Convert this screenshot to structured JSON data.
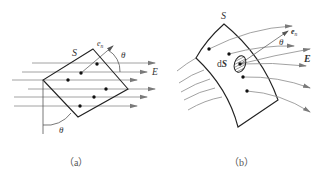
{
  "figure_a": {
    "caption": "（a）",
    "surface_label": "S",
    "normal_label": "e",
    "normal_subscript": "n",
    "angle_label_top": "θ",
    "angle_label_bottom": "θ",
    "field_label": "E",
    "field_line_count": 6,
    "point_count": 6
  },
  "figure_b": {
    "caption": "（b）",
    "surface_label": "S",
    "normal_label": "e",
    "normal_subscript": "n",
    "angle_label": "θ",
    "field_label": "E",
    "element_label_prefix": "d",
    "element_label_var": "S",
    "field_line_count": 9,
    "point_count": 5
  },
  "colors": {
    "outline": "#222222",
    "field_line": "#8a8a8a",
    "arrowhead": "#7a7a7a",
    "dot": "#111111",
    "text": "#333333"
  }
}
